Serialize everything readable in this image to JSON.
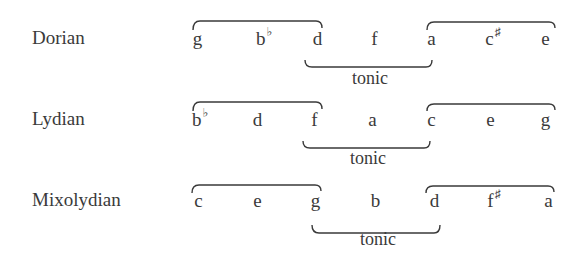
{
  "rows": [
    {
      "mode": "Dorian",
      "notes": [
        {
          "letter": "g",
          "accidental": ""
        },
        {
          "letter": "b",
          "accidental": "♭"
        },
        {
          "letter": "d",
          "accidental": ""
        },
        {
          "letter": "f",
          "accidental": ""
        },
        {
          "letter": "a",
          "accidental": ""
        },
        {
          "letter": "c",
          "accidental": "♯"
        },
        {
          "letter": "e",
          "accidental": ""
        }
      ],
      "tonic_label": "tonic"
    },
    {
      "mode": "Lydian",
      "notes": [
        {
          "letter": "b",
          "accidental": "♭"
        },
        {
          "letter": "d",
          "accidental": ""
        },
        {
          "letter": "f",
          "accidental": ""
        },
        {
          "letter": "a",
          "accidental": ""
        },
        {
          "letter": "c",
          "accidental": ""
        },
        {
          "letter": "e",
          "accidental": ""
        },
        {
          "letter": "g",
          "accidental": ""
        }
      ],
      "tonic_label": "tonic"
    },
    {
      "mode": "Mixolydian",
      "notes": [
        {
          "letter": "c",
          "accidental": ""
        },
        {
          "letter": "e",
          "accidental": ""
        },
        {
          "letter": "g",
          "accidental": ""
        },
        {
          "letter": "b",
          "accidental": ""
        },
        {
          "letter": "d",
          "accidental": ""
        },
        {
          "letter": "f",
          "accidental": "♯"
        },
        {
          "letter": "a",
          "accidental": ""
        }
      ],
      "tonic_label": "tonic"
    }
  ],
  "colors": {
    "ink": "#3a3a3a",
    "background": "#ffffff"
  }
}
